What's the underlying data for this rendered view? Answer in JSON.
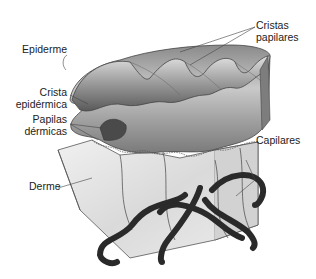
{
  "diagram": {
    "labels": {
      "epiderme": "Epiderme",
      "crista_epidermica_1": "Crista",
      "crista_epidermica_2": "epidérmica",
      "papilas_dermicas_1": "Papilas",
      "papilas_dermicas_2": "dérmicas",
      "derme": "Derme",
      "cristas_papilares_1": "Cristas",
      "cristas_papilares_2": "papilares",
      "capilares": "Capilares"
    },
    "colors": {
      "background": "#ffffff",
      "text": "#222222",
      "epidermis_light": "#c8c8c8",
      "epidermis_dark": "#6e6e6e",
      "dermis": "#e6e6e6",
      "vessels": "#2a2a2a",
      "leader_lines": "#444444"
    }
  }
}
